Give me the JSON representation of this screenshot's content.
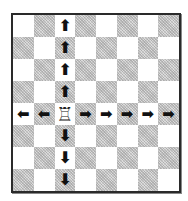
{
  "diagram": {
    "board": {
      "files": [
        "a",
        "b",
        "c",
        "d",
        "e",
        "f",
        "g",
        "h"
      ],
      "ranks": [
        8,
        7,
        6,
        5,
        4,
        3,
        2,
        1
      ],
      "top_left_color": "light",
      "colors": {
        "light": "#ffffff",
        "dark": "#c9c9c9",
        "border": "#2a2a2a"
      }
    },
    "piece": {
      "type": "rook",
      "color": "white",
      "square": "c4",
      "glyph": "♖"
    },
    "arrows": [
      {
        "square": "c8",
        "direction": "up",
        "glyph": "🡅"
      },
      {
        "square": "c7",
        "direction": "up",
        "glyph": "🡅"
      },
      {
        "square": "c6",
        "direction": "up",
        "glyph": "🡅"
      },
      {
        "square": "c5",
        "direction": "up",
        "glyph": "🡅"
      },
      {
        "square": "c3",
        "direction": "down",
        "glyph": "🡇"
      },
      {
        "square": "c2",
        "direction": "down",
        "glyph": "🡇"
      },
      {
        "square": "c1",
        "direction": "down",
        "glyph": "🡇"
      },
      {
        "square": "a4",
        "direction": "left",
        "glyph": "🡄"
      },
      {
        "square": "b4",
        "direction": "left",
        "glyph": "🡄"
      },
      {
        "square": "d4",
        "direction": "right",
        "glyph": "🡆"
      },
      {
        "square": "e4",
        "direction": "right",
        "glyph": "🡆"
      },
      {
        "square": "f4",
        "direction": "right",
        "glyph": "🡆"
      },
      {
        "square": "g4",
        "direction": "right",
        "glyph": "🡆"
      },
      {
        "square": "h4",
        "direction": "right",
        "glyph": "🡆"
      }
    ]
  }
}
